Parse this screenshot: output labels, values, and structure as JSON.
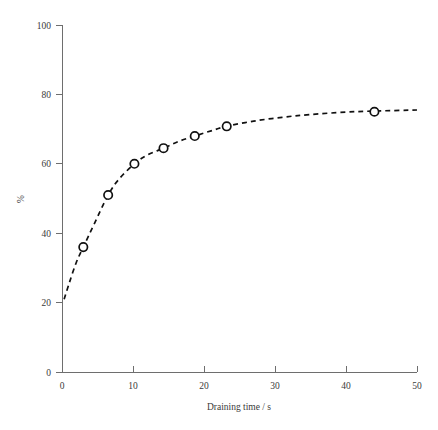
{
  "figure": {
    "width": 438,
    "height": 430,
    "background": "#ffffff",
    "ink_color": "#111111",
    "axis_color": "#6e6e6e",
    "text_color": "#3a3a3a"
  },
  "axes": {
    "x": {
      "title": "Draining time / s",
      "ticks": [
        "0",
        "10",
        "20",
        "30",
        "40",
        "50"
      ],
      "min": 0,
      "max": 50
    },
    "y": {
      "title": "%",
      "ticks": [
        "0",
        "20",
        "40",
        "60",
        "80",
        "100"
      ],
      "min": 0,
      "max": 100
    }
  },
  "chart_data": {
    "type": "line",
    "title": "",
    "subtitle": "",
    "xlabel": "Draining time / s",
    "ylabel": "%",
    "xlim": [
      0,
      50
    ],
    "ylim": [
      0,
      100
    ],
    "xticks": [
      0,
      10,
      20,
      30,
      40,
      50
    ],
    "yticks": [
      0,
      20,
      40,
      60,
      80,
      100
    ],
    "grid": false,
    "legend": false,
    "legend_position": "none",
    "line_style": "dashed",
    "marker": "open-circle",
    "series": [
      {
        "name": "Drained fraction",
        "x": [
          3,
          6.5,
          10.2,
          14.3,
          18.7,
          23.2,
          44
        ],
        "values": [
          36,
          51,
          60,
          64.5,
          68,
          70.8,
          75
        ]
      }
    ],
    "curve": {
      "description": "Smooth dashed rising curve through the markers, starting near (0.3, 21) and flattening to an asymptote near 75.5%",
      "x": [
        0.3,
        1,
        2,
        3,
        4.5,
        6.5,
        8,
        10.2,
        12,
        14.3,
        16.5,
        18.7,
        21,
        23.2,
        27,
        31,
        35,
        40,
        44,
        50
      ],
      "y": [
        21,
        25.5,
        31.5,
        36,
        42.5,
        51,
        55.5,
        60,
        62.5,
        64.5,
        66.5,
        68,
        69.5,
        70.8,
        72.3,
        73.4,
        74.2,
        74.9,
        75.2,
        75.5
      ]
    }
  }
}
